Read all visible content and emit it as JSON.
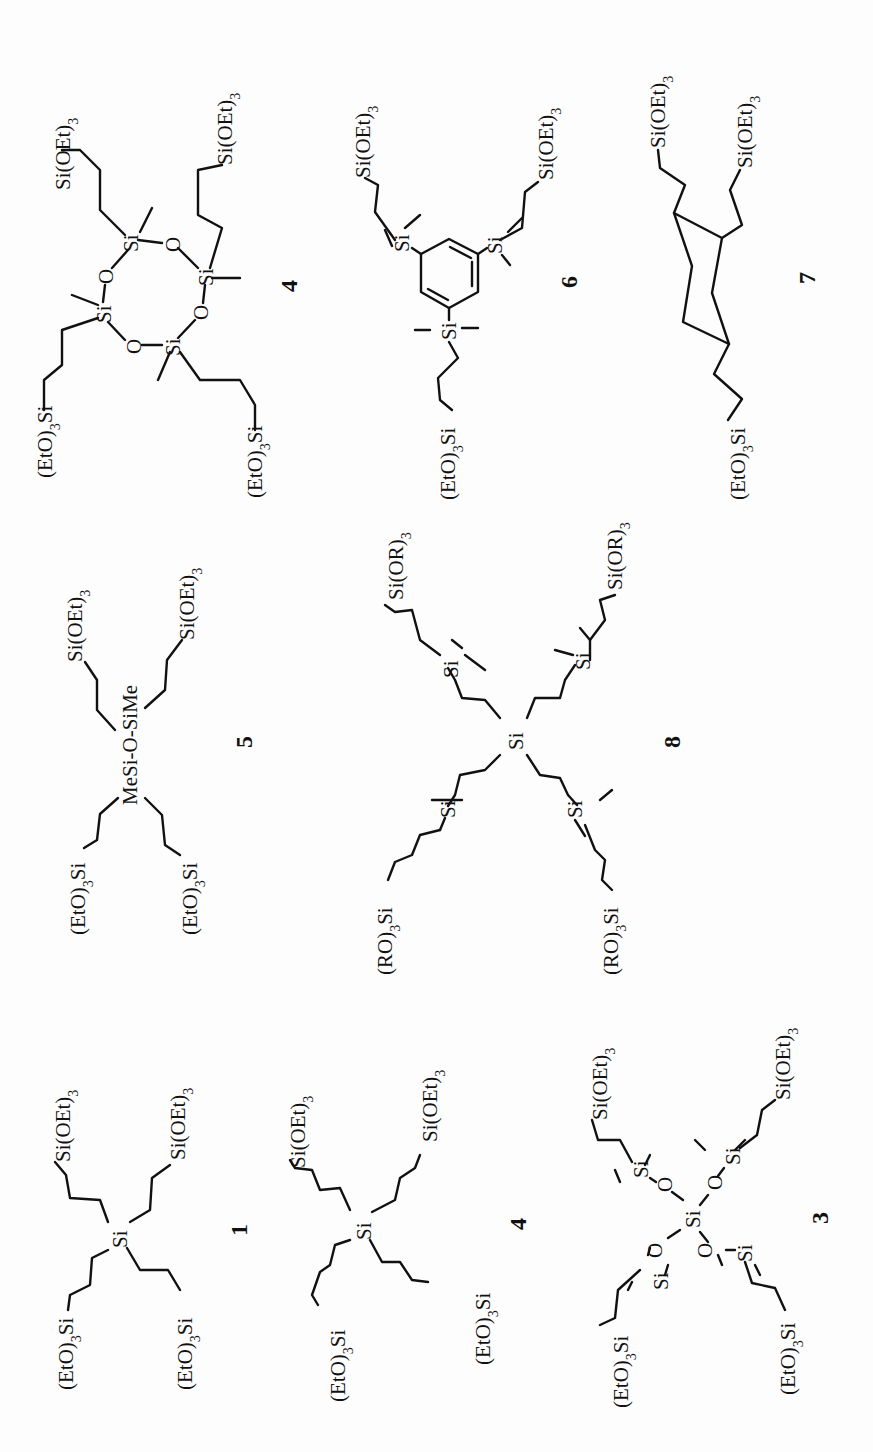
{
  "figure": {
    "orientation": "rotated 90 degrees counter-clockwise",
    "compounds": [
      {
        "id": "c1",
        "label": "1",
        "core": "Si",
        "arms": [
          "(EtO)3Si",
          "Si(OEt)3",
          "(EtO)3Si",
          "Si(OEt)3"
        ]
      },
      {
        "id": "c4a",
        "label": "4",
        "core": "Si",
        "arms": [
          "(EtO)3Si",
          "Si(OEt)3",
          "(EtO)3Si",
          "Si(OEt)3"
        ]
      },
      {
        "id": "c3",
        "label": "3",
        "core": "Si(OSiMe2)4",
        "arms": [
          "(EtO)3Si",
          "Si(OEt)3",
          "(EtO)3Si",
          "Si(OEt)3"
        ]
      },
      {
        "id": "c5",
        "label": "5",
        "core": "MeSi-O-SiMe",
        "arms": [
          "(EtO)3Si",
          "Si(OEt)3",
          "(EtO)3Si",
          "Si(OEt)3"
        ]
      },
      {
        "id": "c8",
        "label": "8",
        "core": "Si",
        "arms": [
          "(RO)3Si",
          "Si(OR)3",
          "(RO)3Si",
          "Si(OR)3"
        ]
      },
      {
        "id": "c4b",
        "label": "4",
        "core": "cyclotetrasiloxane",
        "arms": [
          "(EtO)3Si",
          "Si(OEt)3",
          "(EtO)3Si",
          "Si(OEt)3"
        ]
      },
      {
        "id": "c6",
        "label": "6",
        "core": "1,3,5-tris(dimethylsilyl)benzene",
        "arms": [
          "(EtO)3Si",
          "Si(OEt)3",
          "Si(OEt)3"
        ]
      },
      {
        "id": "c7",
        "label": "7",
        "core": "cyclohexane",
        "arms": [
          "(EtO)3Si",
          "Si(OEt)3",
          "Si(OEt)3"
        ]
      }
    ]
  },
  "text": {
    "si": "Si",
    "o": "O",
    "eto3si_main": "(EtO)",
    "eto3si_tail": "Si",
    "sioet3_main": "Si(OEt)",
    "ro3si_main": "(RO)",
    "sior3_main": "Si(OR)",
    "three": "3",
    "mesi_o_sime": "MeSi-O-SiMe",
    "label_1": "1",
    "label_3": "3",
    "label_4": "4",
    "label_5": "5",
    "label_6": "6",
    "label_7": "7",
    "label_8": "8"
  }
}
